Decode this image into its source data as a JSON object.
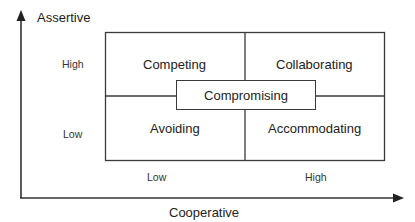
{
  "diagram": {
    "y_axis_title": "Assertive",
    "x_axis_title": "Cooperative",
    "y_ticks": {
      "high": "High",
      "low": "Low"
    },
    "x_ticks": {
      "low": "Low",
      "high": "High"
    },
    "quadrants": {
      "top_left": "Competing",
      "top_right": "Collaborating",
      "bottom_left": "Avoiding",
      "bottom_right": "Accommodating"
    },
    "center": "Compromising",
    "colors": {
      "line": "#3a3a3a",
      "background": "#ffffff",
      "text": "#222222"
    }
  }
}
